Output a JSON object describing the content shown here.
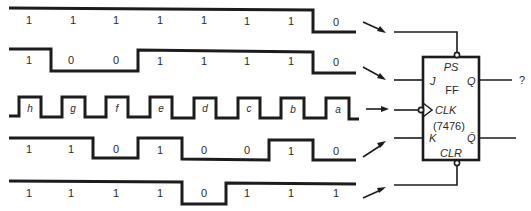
{
  "diagram": {
    "time_slots": 8,
    "waveforms": [
      {
        "name": "PS",
        "values": [
          "1",
          "1",
          "1",
          "1",
          "1",
          "1",
          "1",
          "0"
        ]
      },
      {
        "name": "J",
        "values": [
          "1",
          "0",
          "0",
          "1",
          "1",
          "1",
          "1",
          "0"
        ]
      },
      {
        "name": "CLK",
        "pulse_labels": [
          "h",
          "g",
          "f",
          "e",
          "d",
          "c",
          "b",
          "a"
        ]
      },
      {
        "name": "K",
        "values": [
          "1",
          "1",
          "0",
          "1",
          "0",
          "0",
          "1",
          "0"
        ]
      },
      {
        "name": "CLR",
        "values": [
          "1",
          "1",
          "1",
          "1",
          "0",
          "1",
          "1",
          "1"
        ]
      }
    ],
    "flip_flop": {
      "name": "FF",
      "part_number": "(7476)",
      "pins": {
        "preset": "PS",
        "j": "J",
        "clock": "CLK",
        "k": "K",
        "clear": "CLR",
        "q": "Q",
        "q_bar": "Q̄"
      },
      "output_label": "?"
    }
  }
}
